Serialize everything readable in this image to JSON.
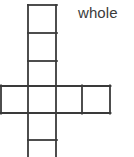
{
  "figure": {
    "title": "whole",
    "kind": "polyomino-grid-diagram",
    "shape_name": "cross-pentomino-extended",
    "label": {
      "text": "whole",
      "x": 78,
      "y": 17,
      "font_size": 15,
      "color": "#3b3b3b"
    },
    "style": {
      "stroke_color": "#3a3a3a",
      "stroke_width": 1.8,
      "fill_color": "#ffffff",
      "background": "#ffffff"
    },
    "canvas": {
      "width": 134,
      "height": 157
    },
    "cell_size": 27.5,
    "counts": {
      "total_cells_visible": 9,
      "vertical_column_cells": 5,
      "horizontal_row_cells": 4
    },
    "cells": [
      {
        "name": "column-cell-1",
        "x": 28,
        "y": 5,
        "w": 28,
        "h": 28,
        "clipped": false
      },
      {
        "name": "column-cell-2",
        "x": 28,
        "y": 33,
        "w": 28,
        "h": 28,
        "clipped": false
      },
      {
        "name": "column-cell-3",
        "x": 28,
        "y": 61,
        "w": 28,
        "h": 25,
        "clipped": false
      },
      {
        "name": "row-cell-1",
        "x": 1,
        "y": 86,
        "w": 27,
        "h": 27,
        "clipped": false
      },
      {
        "name": "row-cell-2",
        "x": 28,
        "y": 86,
        "w": 28,
        "h": 27,
        "clipped": false
      },
      {
        "name": "row-cell-3",
        "x": 56,
        "y": 86,
        "w": 26,
        "h": 27,
        "clipped": false
      },
      {
        "name": "row-cell-4",
        "x": 82,
        "y": 86,
        "w": 28,
        "h": 27,
        "clipped": false
      },
      {
        "name": "column-cell-4",
        "x": 28,
        "y": 113,
        "w": 28,
        "h": 27,
        "clipped": false
      },
      {
        "name": "column-cell-5",
        "x": 28,
        "y": 140,
        "w": 28,
        "h": 17,
        "clipped": true
      }
    ],
    "segments": [
      {
        "name": "column-top-edge",
        "x1": 28,
        "y1": 5,
        "x2": 56,
        "y2": 5
      },
      {
        "name": "column-divider-1",
        "x1": 28,
        "y1": 33,
        "x2": 56,
        "y2": 33
      },
      {
        "name": "column-divider-2",
        "x1": 28,
        "y1": 61,
        "x2": 56,
        "y2": 61
      },
      {
        "name": "row-top-edge",
        "x1": 1,
        "y1": 86,
        "x2": 110,
        "y2": 86
      },
      {
        "name": "row-bottom-edge",
        "x1": 1,
        "y1": 113,
        "x2": 110,
        "y2": 113
      },
      {
        "name": "column-divider-3",
        "x1": 28,
        "y1": 140,
        "x2": 56,
        "y2": 140
      },
      {
        "name": "column-left-edge",
        "x1": 28,
        "y1": 5,
        "x2": 28,
        "y2": 157
      },
      {
        "name": "column-right-edge",
        "x1": 56,
        "y1": 5,
        "x2": 56,
        "y2": 157
      },
      {
        "name": "row-left-edge",
        "x1": 1,
        "y1": 86,
        "x2": 1,
        "y2": 113
      },
      {
        "name": "row-divider-right",
        "x1": 82,
        "y1": 86,
        "x2": 82,
        "y2": 113
      },
      {
        "name": "row-right-edge",
        "x1": 110,
        "y1": 86,
        "x2": 110,
        "y2": 113
      }
    ]
  }
}
